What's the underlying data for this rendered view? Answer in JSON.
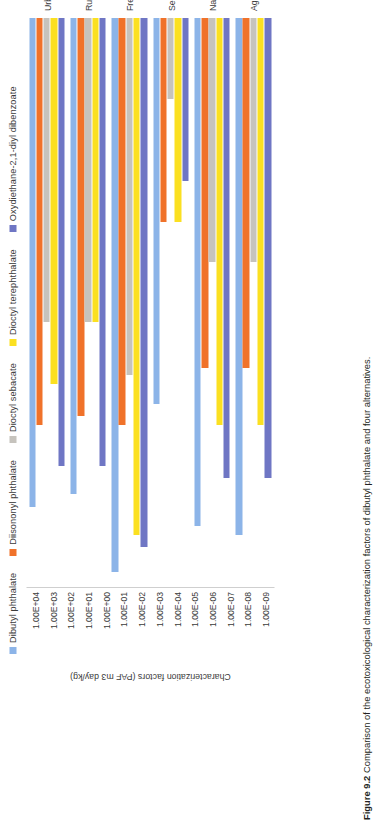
{
  "caption": {
    "figure_number": "Figure 9.2",
    "text": "Comparison of the ecotoxicological characterization factors of dibutyl phthalate and four alternatives."
  },
  "chart_data": {
    "type": "bar",
    "orientation": "horizontal-grouped",
    "title": "",
    "xlabel": "",
    "ylabel": "Characterization factors (PAF m3 day/kg)",
    "categories": [
      "Urban air",
      "Rural air",
      "Freshwater",
      "Seawater",
      "Natural soil",
      "Agricultural soil"
    ],
    "tick_labels": [
      "1.00E+04",
      "1.00E+03",
      "1.00E+02",
      "1.00E+01",
      "1.00E+00",
      "1.00E-01",
      "1.00E-02",
      "1.00E-03",
      "1.00E-04",
      "1.00E-05",
      "1.00E-06",
      "1.00E-07",
      "1.00E-08",
      "1.00E-09"
    ],
    "scale": "log",
    "ylim": [
      1e-09,
      10000
    ],
    "grid": false,
    "legend_position": "top",
    "series": [
      {
        "name": "Dibutyl phthalate",
        "color": "#8cb4e8",
        "values": [
          100.0,
          50.0,
          4000.0,
          0.3,
          300.0,
          500.0
        ]
      },
      {
        "name": "Diisononyl phthalate",
        "color": "#f0722a",
        "values": [
          1.0,
          0.6,
          1.0,
          1e-05,
          0.04,
          0.04
        ]
      },
      {
        "name": "Dioctyl sebacate",
        "color": "#c6c3bd",
        "values": [
          0.003,
          0.003,
          0.06,
          1e-08,
          0.0001,
          0.0001
        ]
      },
      {
        "name": "Dioctyl terephthalate",
        "color": "#fbe021",
        "values": [
          0.1,
          0.003,
          500.0,
          1e-05,
          1.0,
          1.0
        ]
      },
      {
        "name": "Oxydiethane-2,1-diyl dibenzoate",
        "color": "#6f76c4",
        "values": [
          10.0,
          10.0,
          1000.0,
          1e-06,
          20.0,
          20.0
        ]
      }
    ]
  }
}
